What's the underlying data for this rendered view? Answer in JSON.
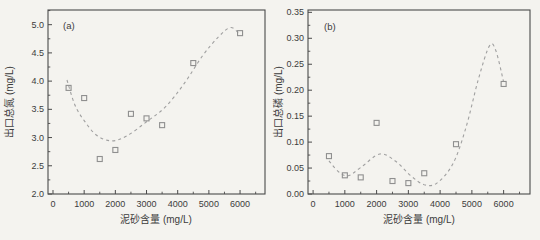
{
  "figure": {
    "background_color": "#f4f3ef",
    "frame_color": "#4a4a4a",
    "text_color": "#3c3c3c",
    "marker_color": "#8f8f8f",
    "curve_color": "#a0a0a0"
  },
  "chart_data": [
    {
      "type": "scatter",
      "panel_label": "(a)",
      "xlabel": "泥砂含量 (mg/L)",
      "ylabel": "出口总氮 (mg/L)",
      "xlim": [
        -160,
        6800
      ],
      "ylim": [
        2.0,
        5.26
      ],
      "xticks": [
        0,
        1000,
        2000,
        3000,
        4000,
        5000,
        6000
      ],
      "xtick_labels": [
        "0",
        "1000",
        "2000",
        "3000",
        "4000",
        "5000",
        "6000"
      ],
      "xminor_ticks": [
        500,
        1500,
        2500,
        3500,
        4500,
        5500,
        6500
      ],
      "yticks": [
        2.0,
        2.5,
        3.0,
        3.5,
        4.0,
        4.5,
        5.0
      ],
      "ytick_labels": [
        "2.0",
        "2.5",
        "3.0",
        "3.5",
        "4.0",
        "4.5",
        "5.0"
      ],
      "yminor_ticks": [
        2.25,
        2.75,
        3.25,
        3.75,
        4.25,
        4.75,
        5.25
      ],
      "grid": false,
      "legend": null,
      "marker": "open-square",
      "trend_line_style": "dashed",
      "points": [
        [
          500,
          3.88
        ],
        [
          1000,
          3.7
        ],
        [
          1500,
          2.62
        ],
        [
          2000,
          2.78
        ],
        [
          2500,
          3.42
        ],
        [
          3000,
          3.34
        ],
        [
          3500,
          3.22
        ],
        [
          4500,
          4.32
        ],
        [
          6000,
          4.85
        ]
      ],
      "trend_curve": [
        [
          450,
          4.02
        ],
        [
          700,
          3.58
        ],
        [
          1000,
          3.3
        ],
        [
          1400,
          3.04
        ],
        [
          1900,
          2.94
        ],
        [
          2400,
          3.04
        ],
        [
          3000,
          3.28
        ],
        [
          3600,
          3.54
        ],
        [
          4200,
          3.95
        ],
        [
          4800,
          4.45
        ],
        [
          5300,
          4.78
        ],
        [
          5700,
          4.95
        ],
        [
          6000,
          4.82
        ]
      ]
    },
    {
      "type": "scatter",
      "panel_label": "(b)",
      "xlabel": "泥砂含量 (mg/L)",
      "ylabel": "出口总磷 (mg/L)",
      "xlim": [
        -160,
        6830
      ],
      "ylim": [
        0.0,
        0.3545
      ],
      "xticks": [
        0,
        1000,
        2000,
        3000,
        4000,
        5000,
        6000
      ],
      "xtick_labels": [
        "0",
        "1000",
        "2000",
        "3000",
        "4000",
        "5000",
        "6000"
      ],
      "xminor_ticks": [
        500,
        1500,
        2500,
        3500,
        4500,
        5500,
        6500
      ],
      "yticks": [
        0.0,
        0.05,
        0.1,
        0.15,
        0.2,
        0.25,
        0.3,
        0.35
      ],
      "ytick_labels": [
        "0.00",
        "0.05",
        "0.10",
        "0.15",
        "0.20",
        "0.25",
        "0.30",
        "0.35"
      ],
      "yminor_ticks": [
        0.025,
        0.075,
        0.125,
        0.175,
        0.225,
        0.275,
        0.325
      ],
      "grid": false,
      "legend": null,
      "marker": "open-square",
      "trend_line_style": "dashed",
      "points": [
        [
          500,
          0.073
        ],
        [
          1000,
          0.036
        ],
        [
          1500,
          0.032
        ],
        [
          2000,
          0.137
        ],
        [
          2500,
          0.025
        ],
        [
          3000,
          0.021
        ],
        [
          3500,
          0.04
        ],
        [
          4500,
          0.096
        ],
        [
          6000,
          0.212
        ]
      ],
      "trend_curve": [
        [
          500,
          0.064
        ],
        [
          800,
          0.043
        ],
        [
          1100,
          0.035
        ],
        [
          1500,
          0.051
        ],
        [
          2100,
          0.077
        ],
        [
          2600,
          0.063
        ],
        [
          3100,
          0.034
        ],
        [
          3500,
          0.018
        ],
        [
          3900,
          0.021
        ],
        [
          4400,
          0.058
        ],
        [
          4800,
          0.125
        ],
        [
          5200,
          0.22
        ],
        [
          5550,
          0.285
        ],
        [
          5750,
          0.277
        ],
        [
          6000,
          0.216
        ]
      ]
    }
  ]
}
